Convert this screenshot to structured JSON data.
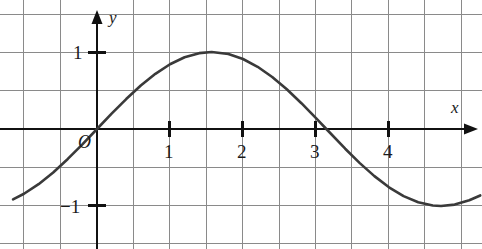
{
  "chart_data": {
    "type": "line",
    "title": "",
    "xlabel": "x",
    "ylabel": "y",
    "function": "y = sin(x)",
    "xlim": [
      -1.35,
      5.25
    ],
    "ylim": [
      -1.5,
      1.55
    ],
    "grid": true,
    "grid_spacing_x": 0.5,
    "grid_spacing_y": 0.5,
    "legend": "none",
    "x_ticks": [
      {
        "value": 1,
        "label": "1"
      },
      {
        "value": 2,
        "label": "2"
      },
      {
        "value": 3,
        "label": "3"
      },
      {
        "value": 4,
        "label": "4"
      }
    ],
    "y_ticks": [
      {
        "value": 1,
        "label": "1"
      },
      {
        "value": -1,
        "label": "−1"
      }
    ],
    "origin_label": "O",
    "series": [
      {
        "name": "y = sin(x)",
        "color": "#3a3a3a",
        "x": [
          -1.15,
          -1.0,
          -0.8,
          -0.6,
          -0.4,
          -0.2,
          0.0,
          0.2,
          0.4,
          0.6,
          0.8,
          1.0,
          1.2,
          1.4,
          1.5708,
          1.8,
          2.0,
          2.2,
          2.4,
          2.6,
          2.8,
          3.0,
          3.1416,
          3.4,
          3.6,
          3.8,
          4.0,
          4.2,
          4.4,
          4.6,
          4.7124,
          4.9,
          5.1,
          5.25
        ],
        "y": [
          -0.913,
          -0.841,
          -0.717,
          -0.565,
          -0.389,
          -0.199,
          0.0,
          0.199,
          0.389,
          0.565,
          0.717,
          0.841,
          0.932,
          0.985,
          1.0,
          0.974,
          0.909,
          0.808,
          0.675,
          0.516,
          0.335,
          0.141,
          0.0,
          -0.256,
          -0.443,
          -0.612,
          -0.757,
          -0.872,
          -0.952,
          -0.994,
          -1.0,
          -0.982,
          -0.926,
          -0.863
        ]
      }
    ]
  },
  "colors": {
    "curve": "#3a3a3a",
    "axis": "#111111",
    "grid": "#8a8a8a",
    "text": "#1a1a1a",
    "background": "#ffffff"
  },
  "labels": {
    "y_axis": "y",
    "x_axis": "x",
    "origin": "O",
    "x_tick_1": "1",
    "x_tick_2": "2",
    "x_tick_3": "3",
    "x_tick_4": "4",
    "y_tick_pos1": "1",
    "y_tick_neg1": "−1"
  }
}
